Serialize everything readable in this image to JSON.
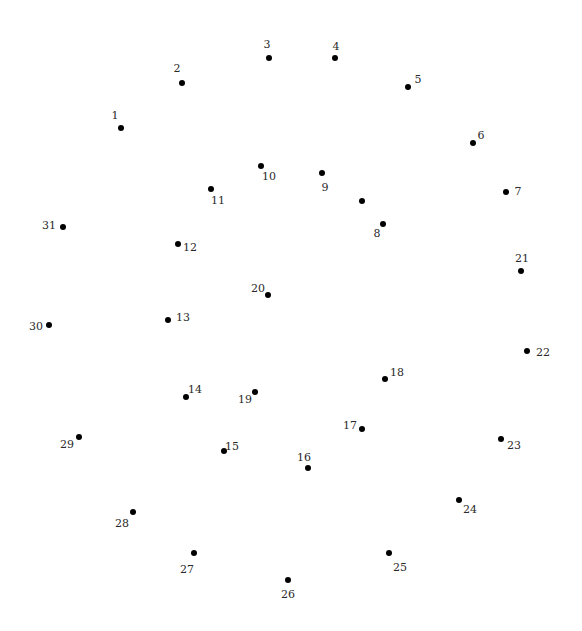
{
  "puzzle": {
    "type": "connect-the-dots",
    "background_color": "#ffffff",
    "dot_color": "#000000",
    "label_color": "#2a2a2a",
    "points": [
      {
        "label": "1",
        "x": 121,
        "y": 128,
        "lx": 115,
        "ly": 115
      },
      {
        "label": "2",
        "x": 182,
        "y": 83,
        "lx": 177,
        "ly": 68
      },
      {
        "label": "3",
        "x": 269,
        "y": 58,
        "lx": 267,
        "ly": 44
      },
      {
        "label": "4",
        "x": 335,
        "y": 58,
        "lx": 336,
        "ly": 46
      },
      {
        "label": "5",
        "x": 408,
        "y": 87,
        "lx": 418,
        "ly": 79
      },
      {
        "label": "6",
        "x": 473,
        "y": 143,
        "lx": 481,
        "ly": 135
      },
      {
        "label": "7",
        "x": 506,
        "y": 192,
        "lx": 518,
        "ly": 191
      },
      {
        "label": "8",
        "x": 383,
        "y": 224,
        "lx": 377,
        "ly": 233
      },
      {
        "label": "9",
        "x": 322,
        "y": 173,
        "lx": 325,
        "ly": 187
      },
      {
        "label": "10",
        "x": 261,
        "y": 166,
        "lx": 269,
        "ly": 176
      },
      {
        "label": "11",
        "x": 211,
        "y": 189,
        "lx": 218,
        "ly": 200
      },
      {
        "label": "12",
        "x": 178,
        "y": 244,
        "lx": 190,
        "ly": 247
      },
      {
        "label": "13",
        "x": 168,
        "y": 320,
        "lx": 183,
        "ly": 317
      },
      {
        "label": "14",
        "x": 186,
        "y": 397,
        "lx": 195,
        "ly": 389
      },
      {
        "label": "15",
        "x": 224,
        "y": 451,
        "lx": 232,
        "ly": 446
      },
      {
        "label": "16",
        "x": 308,
        "y": 468,
        "lx": 304,
        "ly": 457
      },
      {
        "label": "17",
        "x": 362,
        "y": 429,
        "lx": 350,
        "ly": 425
      },
      {
        "label": "18",
        "x": 385,
        "y": 379,
        "lx": 397,
        "ly": 372
      },
      {
        "label": "19",
        "x": 255,
        "y": 392,
        "lx": 245,
        "ly": 399
      },
      {
        "label": "20",
        "x": 268,
        "y": 295,
        "lx": 258,
        "ly": 288
      },
      {
        "label": "21",
        "x": 521,
        "y": 271,
        "lx": 522,
        "ly": 258
      },
      {
        "label": "22",
        "x": 527,
        "y": 351,
        "lx": 543,
        "ly": 352
      },
      {
        "label": "23",
        "x": 501,
        "y": 439,
        "lx": 514,
        "ly": 445
      },
      {
        "label": "24",
        "x": 459,
        "y": 500,
        "lx": 470,
        "ly": 509
      },
      {
        "label": "25",
        "x": 389,
        "y": 553,
        "lx": 400,
        "ly": 567
      },
      {
        "label": "26",
        "x": 288,
        "y": 580,
        "lx": 288,
        "ly": 594
      },
      {
        "label": "27",
        "x": 194,
        "y": 553,
        "lx": 187,
        "ly": 569
      },
      {
        "label": "28",
        "x": 133,
        "y": 512,
        "lx": 122,
        "ly": 523
      },
      {
        "label": "29",
        "x": 79,
        "y": 437,
        "lx": 67,
        "ly": 444
      },
      {
        "label": "30",
        "x": 49,
        "y": 325,
        "lx": 36,
        "ly": 326
      },
      {
        "label": "31",
        "x": 63,
        "y": 227,
        "lx": 49,
        "ly": 225
      }
    ],
    "unlabeled_points": [
      {
        "x": 362,
        "y": 201
      }
    ]
  }
}
